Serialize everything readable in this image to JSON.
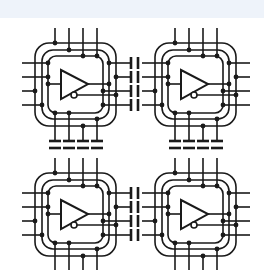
{
  "canvas": {
    "width": 264,
    "height": 280,
    "background": "#ffffff",
    "band_color": "#eef3fa"
  },
  "diagram": {
    "title": "",
    "cells": [
      {
        "id": "cell-top-left",
        "x": 0,
        "y": 0,
        "symbol": "inverting-buffer-triangle"
      },
      {
        "id": "cell-top-right",
        "x": 120,
        "y": 0,
        "symbol": "inverting-buffer-triangle"
      },
      {
        "id": "cell-bottom-left",
        "x": 0,
        "y": 130,
        "symbol": "inverting-buffer-triangle"
      },
      {
        "id": "cell-bottom-right",
        "x": 120,
        "y": 130,
        "symbol": "inverting-buffer-triangle"
      }
    ],
    "couplings": {
      "horizontal_capacitor_rows": 4,
      "vertical_capacitor_columns": 4
    },
    "stroke_color": "#1a1a1a"
  }
}
